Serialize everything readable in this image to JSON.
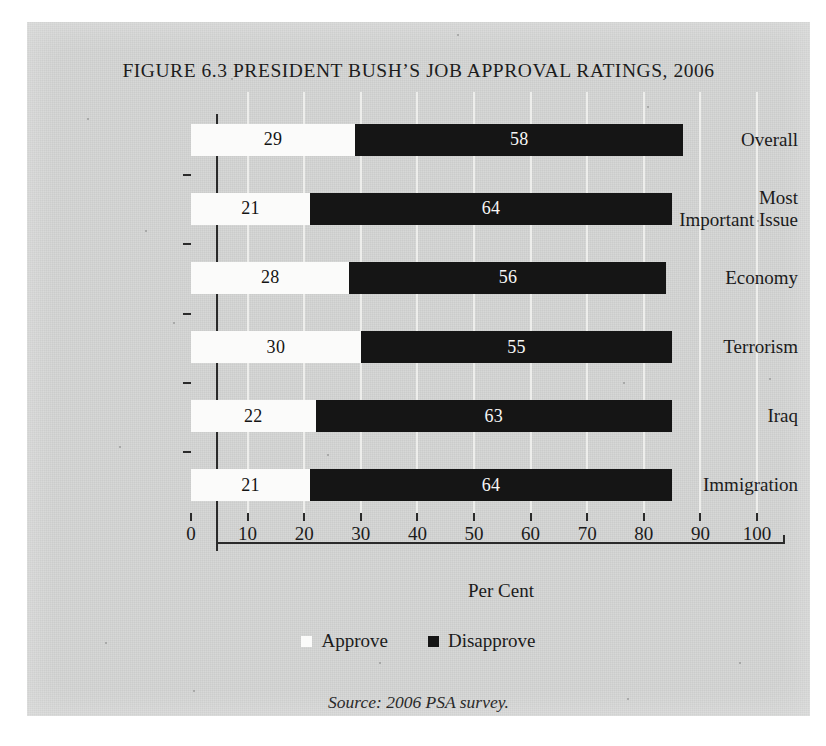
{
  "figure": {
    "title": "FIGURE 6.3 PRESIDENT BUSH’S JOB APPROVAL RATINGS, 2006",
    "source_note": "Source: 2006 PSA survey.",
    "panel_color": "#d3d4d3",
    "approve_color": "#fbfbfa",
    "disapprove_color": "#151515"
  },
  "chart_data": {
    "type": "bar",
    "orientation": "horizontal",
    "stacked": true,
    "title": "FIGURE 6.3 PRESIDENT BUSH’S JOB APPROVAL RATINGS, 2006",
    "xlabel": "Per Cent",
    "ylabel": "",
    "xlim": [
      0,
      100
    ],
    "xticks": [
      0,
      10,
      20,
      30,
      40,
      50,
      60,
      70,
      80,
      90,
      100
    ],
    "xtick_labels": [
      "0",
      "10",
      "20",
      "30",
      "40",
      "50",
      "60",
      "70",
      "80",
      "90",
      "100"
    ],
    "grid": "vertical",
    "legend_position": "bottom",
    "categories": [
      "Overall",
      "Most\nImportant Issue",
      "Economy",
      "Terrorism",
      "Iraq",
      "Immigration"
    ],
    "category_labels": [
      [
        "Overall"
      ],
      [
        "Most",
        "Important Issue"
      ],
      [
        "Economy"
      ],
      [
        "Terrorism"
      ],
      [
        "Iraq"
      ],
      [
        "Immigration"
      ]
    ],
    "series": [
      {
        "name": "Approve",
        "color": "#fbfbfa",
        "values": [
          29,
          21,
          28,
          30,
          22,
          21
        ]
      },
      {
        "name": "Disapprove",
        "color": "#151515",
        "values": [
          58,
          64,
          56,
          55,
          63,
          64
        ]
      }
    ],
    "data_labels": {
      "Overall": {
        "Approve": "29",
        "Disapprove": "58"
      },
      "Most Important Issue": {
        "Approve": "21",
        "Disapprove": "64"
      },
      "Economy": {
        "Approve": "28",
        "Disapprove": "56"
      },
      "Terrorism": {
        "Approve": "30",
        "Disapprove": "55"
      },
      "Iraq": {
        "Approve": "22",
        "Disapprove": "63"
      },
      "Immigration": {
        "Approve": "21",
        "Disapprove": "64"
      }
    }
  },
  "legend": {
    "items": [
      {
        "label": "Approve",
        "swatch": "white-square"
      },
      {
        "label": "Disapprove",
        "swatch": "black-square"
      }
    ]
  }
}
